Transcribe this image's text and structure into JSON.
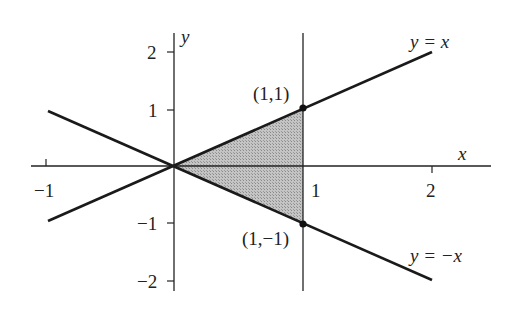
{
  "figure": {
    "axes": {
      "x_label": "x",
      "y_label": "y",
      "x_ticks": [
        {
          "value": -1,
          "label": "−1"
        },
        {
          "value": 1,
          "label": "1"
        },
        {
          "value": 2,
          "label": "2"
        }
      ],
      "y_ticks": [
        {
          "value": 2,
          "label": "2"
        },
        {
          "value": 1,
          "label": "1"
        },
        {
          "value": -1,
          "label": "−1"
        },
        {
          "value": -2,
          "label": "−2"
        }
      ]
    },
    "lines": [
      {
        "label": "y = x",
        "from": [
          -1,
          -1
        ],
        "to": [
          2,
          2
        ]
      },
      {
        "label": "y = −x",
        "from": [
          -1,
          1
        ],
        "to": [
          2,
          -2
        ]
      },
      {
        "label": "x = 1",
        "vertical": true
      }
    ],
    "points": [
      {
        "label": "(1,1)",
        "x": 1,
        "y": 1
      },
      {
        "label": "(1,−1)",
        "x": 1,
        "y": -1
      }
    ],
    "shaded_region": {
      "description": "triangle with vertices (0,0), (1,1), (1,-1)",
      "fill": "#b8b8b8"
    },
    "colors": {
      "line": "#1a1a1a",
      "background": "#ffffff",
      "shade": "#b8b8b8"
    }
  }
}
